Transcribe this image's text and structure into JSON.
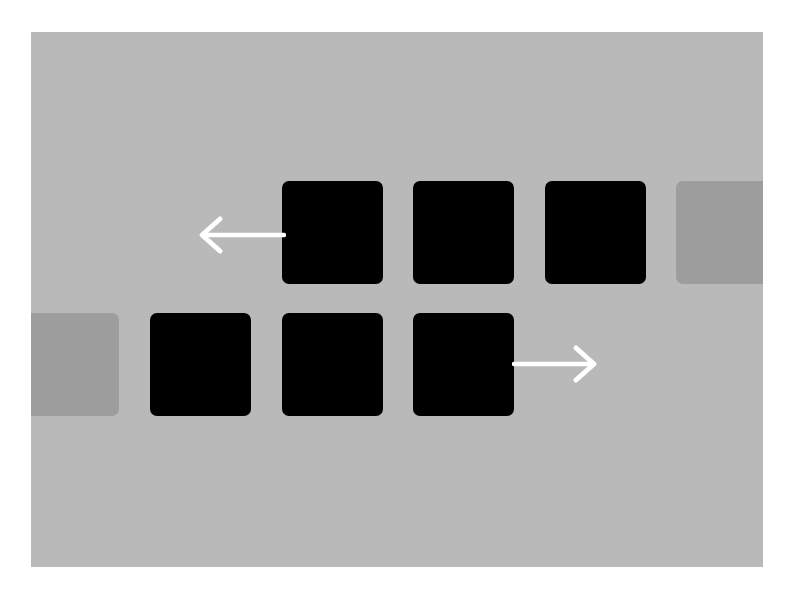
{
  "figure": {
    "background_color": "#ffffff",
    "panel_color": "#b9b9b9",
    "colors": {
      "black_square": "#000000",
      "gray_square": "#9d9d9d",
      "arrow": "#ffffff"
    },
    "rows": [
      {
        "name": "top-row",
        "direction": "left",
        "squares": [
          {
            "type": "black",
            "x": 251,
            "y": 149,
            "w": 101,
            "h": 103
          },
          {
            "type": "black",
            "x": 382,
            "y": 149,
            "w": 101,
            "h": 103
          },
          {
            "type": "black",
            "x": 514,
            "y": 149,
            "w": 101,
            "h": 103
          },
          {
            "type": "gray",
            "x": 645,
            "y": 149,
            "w": 101,
            "h": 103
          }
        ],
        "arrow": {
          "from_x": 251,
          "to_x": 170,
          "y": 202
        }
      },
      {
        "name": "bottom-row",
        "direction": "right",
        "squares": [
          {
            "type": "gray",
            "x": -14,
            "y": 281,
            "w": 102,
            "h": 103
          },
          {
            "type": "black",
            "x": 119,
            "y": 281,
            "w": 101,
            "h": 103
          },
          {
            "type": "black",
            "x": 251,
            "y": 281,
            "w": 101,
            "h": 103
          },
          {
            "type": "black",
            "x": 382,
            "y": 281,
            "w": 101,
            "h": 103
          }
        ],
        "arrow": {
          "from_x": 483,
          "to_x": 563,
          "y": 332
        }
      }
    ]
  }
}
